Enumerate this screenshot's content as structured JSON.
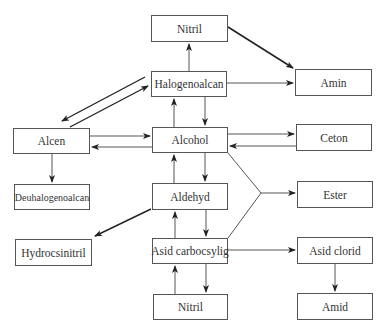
{
  "top_fragment": "",
  "nodes": {
    "nitril_top": {
      "label": "Nitril"
    },
    "halogenoalcan": {
      "label": "Halogenoalcan"
    },
    "amin": {
      "label": "Amin"
    },
    "alcen": {
      "label": "Alcen"
    },
    "alcohol": {
      "label": "Alcohol"
    },
    "ceton": {
      "label": "Ceton"
    },
    "deuhalogenoalcan": {
      "label": "Deuhalogenoalcan"
    },
    "aldehyd": {
      "label": "Aldehyd"
    },
    "ester": {
      "label": "Ester"
    },
    "hydrocsinitril": {
      "label": "Hydrocsinitril"
    },
    "asid_carbocsylig": {
      "label": "Asid carbocsylig"
    },
    "asid_clorid": {
      "label": "Asid clorid"
    },
    "nitril_bottom": {
      "label": "Nitril"
    },
    "amid": {
      "label": "Amid"
    }
  },
  "edges": [
    {
      "from": "Nitril",
      "to": "Amin"
    },
    {
      "from": "Halogenoalcan",
      "to": "Nitril"
    },
    {
      "from": "Halogenoalcan",
      "to": "Amin"
    },
    {
      "from": "Halogenoalcan",
      "to": "Alcen"
    },
    {
      "from": "Alcen",
      "to": "Halogenoalcan"
    },
    {
      "from": "Halogenoalcan",
      "to": "Alcohol"
    },
    {
      "from": "Alcohol",
      "to": "Halogenoalcan"
    },
    {
      "from": "Alcen",
      "to": "Alcohol"
    },
    {
      "from": "Alcohol",
      "to": "Alcen"
    },
    {
      "from": "Alcohol",
      "to": "Ceton"
    },
    {
      "from": "Ceton",
      "to": "Alcohol"
    },
    {
      "from": "Alcen",
      "to": "Deuhalogenoalcan"
    },
    {
      "from": "Alcohol",
      "to": "Aldehyd"
    },
    {
      "from": "Aldehyd",
      "to": "Alcohol"
    },
    {
      "from": "Alcohol + Asid carbocsylig",
      "to": "Ester"
    },
    {
      "from": "Aldehyd",
      "to": "Hydrocsinitril"
    },
    {
      "from": "Aldehyd",
      "to": "Asid carbocsylig"
    },
    {
      "from": "Asid carbocsylig",
      "to": "Aldehyd"
    },
    {
      "from": "Asid carbocsylig",
      "to": "Asid clorid"
    },
    {
      "from": "Asid carbocsylig",
      "to": "Nitril"
    },
    {
      "from": "Nitril",
      "to": "Asid carbocsylig"
    },
    {
      "from": "Asid clorid",
      "to": "Amid"
    }
  ],
  "colors": {
    "line": "#555555",
    "arrow": "#222222",
    "box_border": "#555555"
  }
}
